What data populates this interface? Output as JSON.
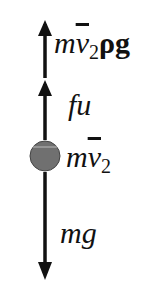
{
  "diagram": {
    "type": "free-body-diagram",
    "object": "ball",
    "ball_color": "#6e6e6e",
    "arrow_color": "#111111",
    "forces": [
      {
        "label": "m v̄₂ ρ g",
        "parts": {
          "m": "m",
          "v": "v",
          "sub": "2",
          "rest": "ρg"
        },
        "direction": "up",
        "position": "top"
      },
      {
        "label": "fu",
        "direction": "up",
        "position": "middle"
      },
      {
        "label": "mg",
        "direction": "down",
        "position": "bottom"
      }
    ],
    "ball_label": {
      "m": "m",
      "v": "v",
      "sub": "2"
    }
  }
}
